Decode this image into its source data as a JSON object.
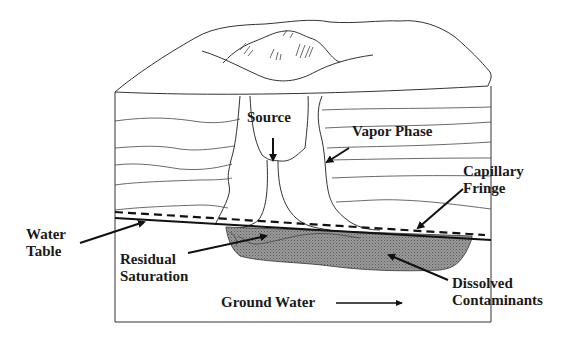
{
  "diagram": {
    "labels": {
      "source": "Source",
      "vapor_phase": "Vapor Phase",
      "capillary_line1": "Capillary",
      "capillary_line2": "Fringe",
      "water_line1": "Water",
      "water_line2": "Table",
      "residual_line1": "Residual",
      "residual_line2": "Saturation",
      "dissolved_line1": "Dissolved",
      "dissolved_line2": "Contaminants",
      "ground_water": "Ground Water"
    },
    "colors": {
      "line": "#333333",
      "plume_fill": "#8a8a8a",
      "text": "#1a1a1a",
      "background": "#ffffff"
    }
  }
}
